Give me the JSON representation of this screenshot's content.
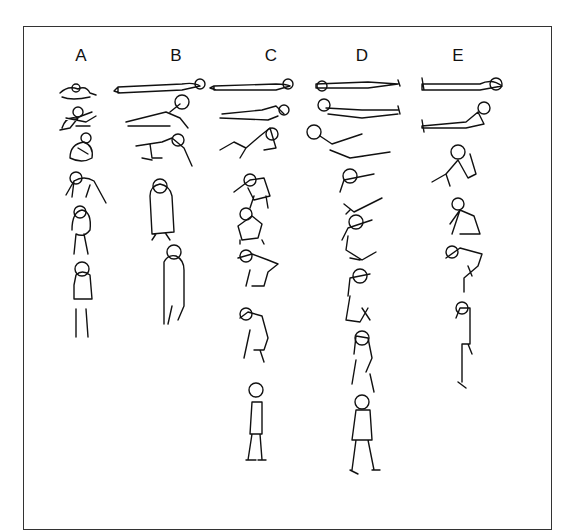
{
  "figure": {
    "columns": [
      {
        "label": "A",
        "x": 81,
        "poses": [
          "curled-lying",
          "rolling-to-side",
          "crouching",
          "pushing-up-hands-and-feet",
          "bending-to-stand",
          "standing"
        ]
      },
      {
        "label": "B",
        "x": 176,
        "poses": [
          "lying-supine",
          "twisting-sit-up",
          "half-kneeling",
          "squat-rising",
          "standing"
        ]
      },
      {
        "label": "C",
        "x": 271,
        "poses": [
          "lying-supine",
          "lying-knees-bent",
          "partial-sit-up",
          "sitting-leaning",
          "squatting",
          "crouched-rising",
          "bending-forward",
          "standing"
        ]
      },
      {
        "label": "D",
        "x": 362,
        "poses": [
          "lying-supine",
          "head-lift",
          "sit-up-arms-forward",
          "sitting-arms-forward",
          "kneel-reach",
          "half-kneeling",
          "lunge-rising",
          "standing-walking"
        ]
      },
      {
        "label": "E",
        "x": 458,
        "poses": [
          "lying-supine",
          "long-sitting",
          "sitting-knees-bent",
          "squatting",
          "deep-squat",
          "standing"
        ]
      }
    ]
  }
}
